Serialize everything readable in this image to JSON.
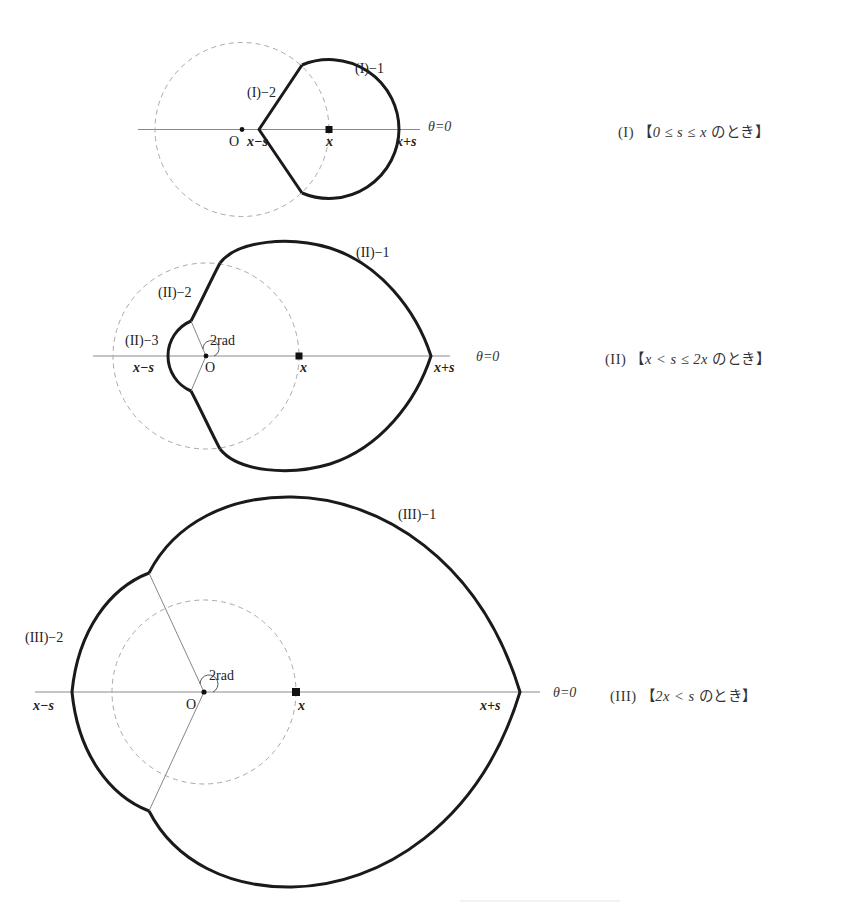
{
  "figures": [
    {
      "id": "I",
      "caption": {
        "numeral": "(I)",
        "open_bracket": "【",
        "condition": "0 ≤ s ≤ x",
        "suffix": "のとき",
        "close_bracket": "】"
      },
      "labels": {
        "curve_1": "(I)−1",
        "curve_2": "(I)−2",
        "origin": "O",
        "x_minus_s": "x−s",
        "x": "x",
        "x_plus_s": "x+s",
        "theta_zero": "θ=0"
      }
    },
    {
      "id": "II",
      "caption": {
        "numeral": "(II)",
        "open_bracket": "【",
        "condition": "x < s ≤ 2x",
        "suffix": "のとき",
        "close_bracket": "】"
      },
      "labels": {
        "curve_1": "(II)−1",
        "curve_2": "(II)−2",
        "curve_3": "(II)−3",
        "angle": "2rad",
        "origin": "O",
        "x_minus_s": "x−s",
        "x": "x",
        "x_plus_s": "x+s",
        "theta_zero": "θ=0"
      }
    },
    {
      "id": "III",
      "caption": {
        "numeral": "(III)",
        "open_bracket": "【",
        "condition": "2x < s",
        "suffix": "のとき",
        "close_bracket": "】"
      },
      "labels": {
        "curve_1": "(III)−1",
        "curve_2": "(III)−2",
        "angle": "2rad",
        "origin": "O",
        "x_minus_s": "x−s",
        "x": "x",
        "x_plus_s": "x+s",
        "theta_zero": "θ=0"
      }
    }
  ],
  "colors": {
    "curve": "#1a1a1a",
    "axis": "#8a8a8a",
    "dashed_circle": "#a9a9a9",
    "background": "#ffffff"
  }
}
